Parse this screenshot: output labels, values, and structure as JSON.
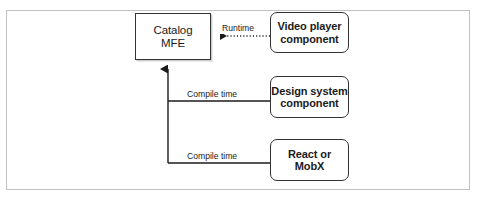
{
  "diagram": {
    "colors": {
      "frame_border": "#c2c2c2",
      "node_border": "#333333",
      "node_fill": "#ffffff",
      "text": "#1b1b1b",
      "connector": "#1b1b1b",
      "background": "#ffffff"
    },
    "nodes": [
      {
        "id": "catalog-mfe",
        "label": "Catalog\nMFE",
        "shape": "rectangle",
        "corner": "square",
        "bold": false,
        "x": 135,
        "y": 13,
        "width": 76,
        "height": 47
      },
      {
        "id": "video-player",
        "label": "Video player\ncomponent",
        "shape": "rectangle",
        "corner": "rounded",
        "bold": true,
        "x": 270,
        "y": 12,
        "width": 79,
        "height": 41
      },
      {
        "id": "design-system",
        "label": "Design system\ncomponent",
        "shape": "rectangle",
        "corner": "rounded",
        "bold": true,
        "x": 270,
        "y": 76,
        "width": 79,
        "height": 42
      },
      {
        "id": "react-mobx",
        "label": "React or\nMobX",
        "shape": "rectangle",
        "corner": "rounded",
        "bold": true,
        "x": 270,
        "y": 139,
        "width": 79,
        "height": 42
      }
    ],
    "edges": [
      {
        "id": "runtime",
        "label": "Runtime",
        "from": "video-player",
        "to": "catalog-mfe",
        "style": "dotted",
        "arrowhead": "left",
        "binding": "runtime"
      },
      {
        "id": "compile-design-system",
        "label": "Compile time",
        "from": "design-system",
        "to": "catalog-mfe",
        "style": "solid",
        "arrowhead": "up",
        "binding": "compile time"
      },
      {
        "id": "compile-react-mobx",
        "label": "Compile time",
        "from": "react-mobx",
        "to": "catalog-mfe",
        "style": "solid",
        "arrowhead": "up",
        "binding": "compile time"
      }
    ]
  }
}
